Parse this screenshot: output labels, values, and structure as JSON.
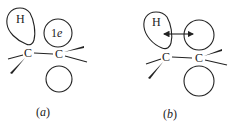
{
  "figure": {
    "panels": [
      {
        "id": "a",
        "label_open": "(",
        "label_letter": "a",
        "label_close": ")",
        "h_label": "H",
        "carbon_left": "C",
        "carbon_right": "C",
        "orbital_label_num": "1",
        "orbital_label_e": "e"
      },
      {
        "id": "b",
        "label_open": "(",
        "label_letter": "b",
        "label_close": ")",
        "h_label": "H",
        "carbon_left": "C",
        "carbon_right": "C"
      }
    ]
  }
}
